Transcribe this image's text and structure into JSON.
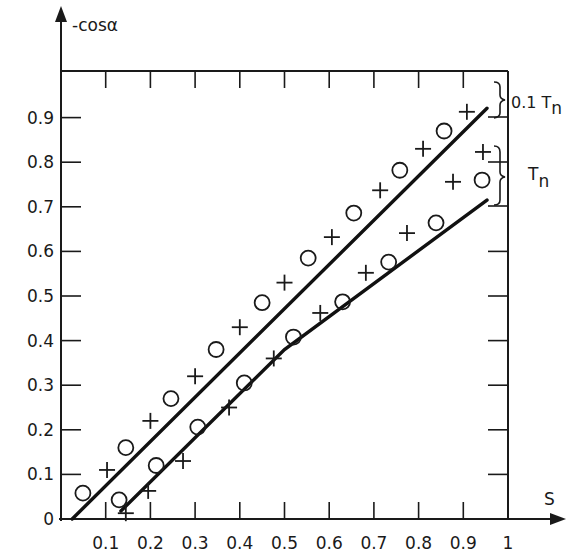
{
  "chart_data": {
    "type": "scatter",
    "title": "",
    "xlabel": "S",
    "ylabel": "-cosα",
    "xlim": [
      0,
      1
    ],
    "ylim": [
      0,
      1
    ],
    "x_ticks": [
      "0.1",
      "0.2",
      "0.3",
      "0.4",
      "0.5",
      "0.6",
      "0.7",
      "0.8",
      "0.9",
      "1"
    ],
    "y_ticks": [
      "0",
      "0.1",
      "0.2",
      "0.3",
      "0.4",
      "0.5",
      "0.6",
      "0.7",
      "0.8",
      "0.9"
    ],
    "grid": false,
    "annotations": [
      {
        "text": "0.1 T",
        "subscript": "n",
        "type": "brace",
        "y_range": [
          0.91,
          0.98
        ]
      },
      {
        "text": "T",
        "subscript": "n",
        "type": "brace",
        "y_range": [
          0.7,
          0.84
        ]
      }
    ],
    "series": [
      {
        "name": "upper circles",
        "marker": "circle",
        "points": [
          [
            0.049,
            0.058
          ],
          [
            0.145,
            0.16
          ],
          [
            0.246,
            0.27
          ],
          [
            0.347,
            0.38
          ],
          [
            0.45,
            0.485
          ],
          [
            0.553,
            0.585
          ],
          [
            0.655,
            0.686
          ],
          [
            0.758,
            0.782
          ],
          [
            0.857,
            0.87
          ]
        ]
      },
      {
        "name": "upper crosses",
        "marker": "cross",
        "points": [
          [
            0.103,
            0.11
          ],
          [
            0.2,
            0.22
          ],
          [
            0.3,
            0.32
          ],
          [
            0.4,
            0.43
          ],
          [
            0.5,
            0.53
          ],
          [
            0.606,
            0.632
          ],
          [
            0.714,
            0.737
          ],
          [
            0.81,
            0.83
          ],
          [
            0.908,
            0.913
          ]
        ]
      },
      {
        "name": "lower circles",
        "marker": "circle",
        "points": [
          [
            0.13,
            0.043
          ],
          [
            0.213,
            0.12
          ],
          [
            0.306,
            0.206
          ],
          [
            0.41,
            0.305
          ],
          [
            0.52,
            0.408
          ],
          [
            0.63,
            0.487
          ],
          [
            0.733,
            0.576
          ],
          [
            0.839,
            0.664
          ],
          [
            0.942,
            0.76
          ]
        ]
      },
      {
        "name": "lower crosses",
        "marker": "cross",
        "points": [
          [
            0.145,
            0.013
          ],
          [
            0.195,
            0.063
          ],
          [
            0.273,
            0.13
          ],
          [
            0.376,
            0.25
          ],
          [
            0.476,
            0.36
          ],
          [
            0.58,
            0.462
          ],
          [
            0.682,
            0.552
          ],
          [
            0.774,
            0.641
          ],
          [
            0.877,
            0.756
          ],
          [
            0.944,
            0.823
          ]
        ]
      },
      {
        "name": "upper fit line",
        "marker": "line",
        "points": [
          [
            0.025,
            0.0
          ],
          [
            0.953,
            0.921
          ]
        ]
      },
      {
        "name": "lower fit line",
        "marker": "line",
        "points": [
          [
            0.134,
            0.018
          ],
          [
            0.5,
            0.38
          ],
          [
            0.953,
            0.715
          ]
        ]
      }
    ]
  },
  "labels": {
    "ylabel": "-cosα",
    "xlabel": "S",
    "brace_top": "0.1 T",
    "brace_top_sub": "n",
    "brace_bottom": "T",
    "brace_bottom_sub": "n"
  }
}
